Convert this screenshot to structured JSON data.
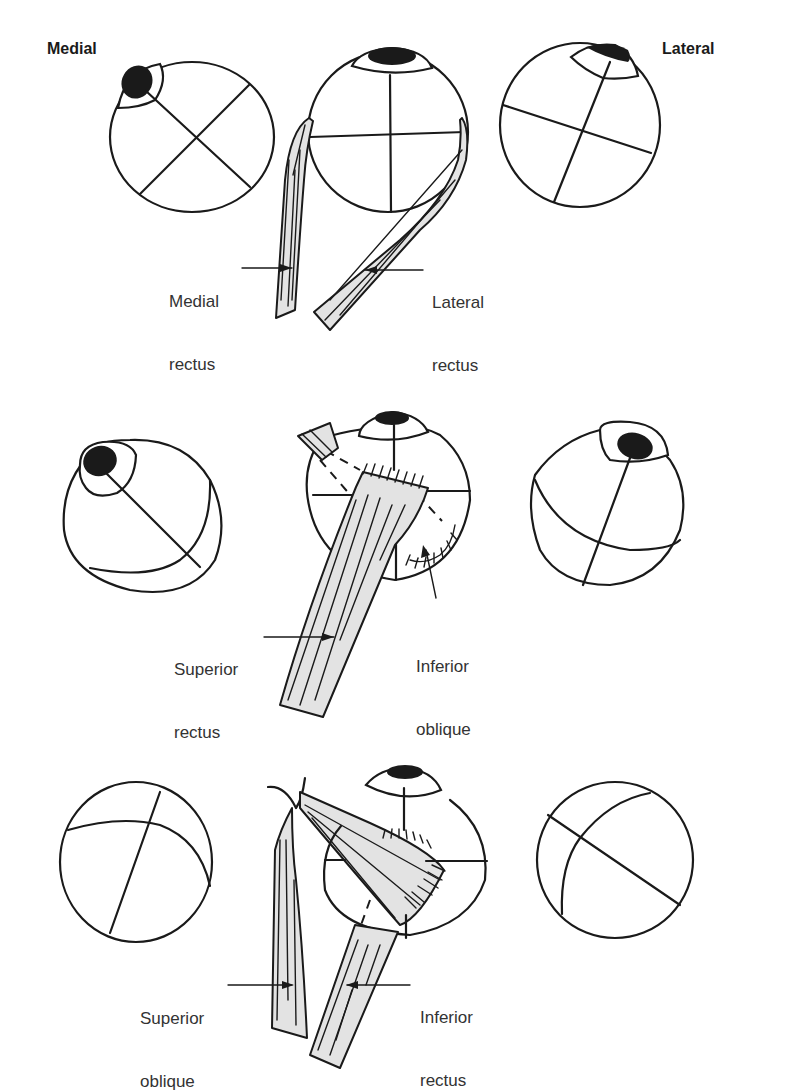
{
  "orientation": {
    "left_label": "Medial",
    "right_label": "Lateral"
  },
  "rows": [
    {
      "name": "horizontal-recti",
      "labels": [
        {
          "id": "medial_rectus",
          "line1": "Medial",
          "line2": "rectus"
        },
        {
          "id": "lateral_rectus",
          "line1": "Lateral",
          "line2": "rectus"
        }
      ]
    },
    {
      "name": "superior-rectus-inferior-oblique",
      "labels": [
        {
          "id": "superior_rectus",
          "line1": "Superior",
          "line2": "rectus"
        },
        {
          "id": "inferior_oblique",
          "line1": "Inferior",
          "line2": "oblique"
        }
      ]
    },
    {
      "name": "superior-oblique-inferior-rectus",
      "labels": [
        {
          "id": "superior_oblique",
          "line1": "Superior",
          "line2": "oblique"
        },
        {
          "id": "inferior_rectus",
          "line1": "Inferior",
          "line2": "rectus"
        }
      ]
    }
  ],
  "colors": {
    "line": "#1a1a1a",
    "muscle_fill": "#e3e3e3",
    "label_text": "#333333",
    "background": "#ffffff"
  }
}
